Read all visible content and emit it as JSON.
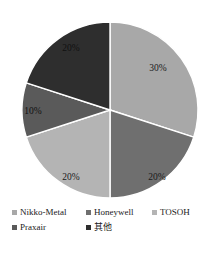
{
  "chart_data": {
    "type": "pie",
    "title": "",
    "labels": [
      "Nikko-Metal",
      "Honeywell",
      "TOSOH",
      "Praxair",
      "其他"
    ],
    "values": [
      30,
      20,
      20,
      10,
      20
    ],
    "value_labels": [
      "30%",
      "20%",
      "20%",
      "10%",
      "20%"
    ],
    "colors": [
      "#a8a8a8",
      "#6f6f6f",
      "#b4b4b4",
      "#5a5a5a",
      "#2e2e2e"
    ],
    "start_angle_deg": 0,
    "direction": "clockwise",
    "legend_position": "bottom",
    "grid": false,
    "units": "percent"
  },
  "legend": {
    "rows": [
      [
        {
          "label": "Nikko-Metal",
          "color": "#a8a8a8",
          "marker": "square-swatch"
        },
        {
          "label": "Honeywell",
          "color": "#6f6f6f",
          "marker": "square-swatch"
        },
        {
          "label": "TOSOH",
          "color": "#b4b4b4",
          "marker": "square-swatch"
        }
      ],
      [
        {
          "label": "Praxair",
          "color": "#5a5a5a",
          "marker": "square-swatch"
        },
        {
          "label": "其他",
          "color": "#2e2e2e",
          "marker": "square-swatch"
        }
      ]
    ]
  },
  "slice_labels": [
    {
      "text": "30%",
      "x": 158,
      "y": 71
    },
    {
      "text": "20%",
      "x": 157,
      "y": 180
    },
    {
      "text": "20%",
      "x": 71,
      "y": 180
    },
    {
      "text": "10%",
      "x": 33,
      "y": 114
    },
    {
      "text": "20%",
      "x": 71,
      "y": 51
    }
  ],
  "geometry": {
    "cx": 110,
    "cy": 110,
    "r": 88,
    "separator_color": "#ffffff",
    "background": "#ffffff"
  }
}
